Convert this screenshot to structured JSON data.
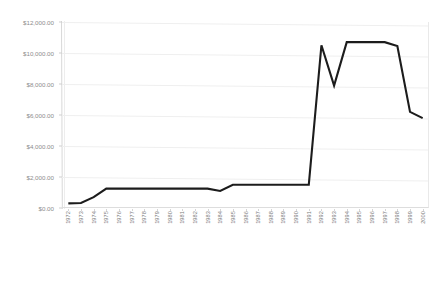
{
  "chart_data": {
    "type": "line",
    "title": "",
    "xlabel": "",
    "ylabel": "",
    "ylim": [
      0,
      12000
    ],
    "ytick_values": [
      0,
      2000,
      4000,
      6000,
      8000,
      10000,
      12000
    ],
    "ytick_labels": [
      "$0.00",
      "$2,000.00",
      "$4,000.00",
      "$6,000.00",
      "$8,000.00",
      "$10,000.00",
      "$12,000.00"
    ],
    "grid": true,
    "grid_axis": "y",
    "legend": false,
    "legend_position": "none",
    "line_color": "#1c1c1c",
    "grid_color": "#efefef",
    "categories": [
      "1972",
      "1973",
      "1974",
      "1975",
      "1976",
      "1977",
      "1978",
      "1979",
      "1980",
      "1981",
      "1982",
      "1983",
      "1984",
      "1985",
      "1986",
      "1987",
      "1988",
      "1989",
      "1990",
      "1991",
      "1992",
      "1993",
      "1994",
      "1995",
      "1996",
      "1997",
      "1998",
      "1999",
      "2000"
    ],
    "series": [
      {
        "name": "Value",
        "values": [
          300,
          320,
          700,
          1250,
          1250,
          1250,
          1250,
          1250,
          1250,
          1250,
          1250,
          1250,
          1100,
          1500,
          1500,
          1500,
          1500,
          1500,
          1500,
          1500,
          10500,
          7900,
          10700,
          10700,
          10700,
          10700,
          10450,
          6200,
          5800
        ]
      }
    ],
    "annotations": []
  }
}
